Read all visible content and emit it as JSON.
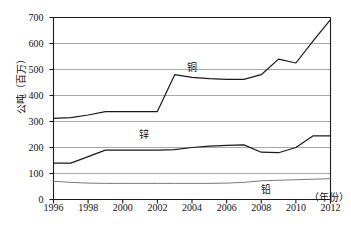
{
  "chart_data": {
    "type": "line",
    "title": "",
    "xlabel": "（年份）",
    "ylabel": "公吨（百万）",
    "xlim": [
      1996,
      2012
    ],
    "ylim": [
      0,
      700
    ],
    "xticks": [
      "1996",
      "1998",
      "2000",
      "2002",
      "2004",
      "2006",
      "2008",
      "2010",
      "2012"
    ],
    "yticks": [
      "0",
      "100",
      "200",
      "300",
      "400",
      "500",
      "600",
      "700"
    ],
    "grid": true,
    "legend_position": "inline-labels",
    "x": [
      1996,
      1997,
      1998,
      1999,
      2000,
      2001,
      2002,
      2003,
      2004,
      2005,
      2006,
      2007,
      2008,
      2009,
      2010,
      2011,
      2012
    ],
    "series": [
      {
        "name": "铜",
        "label": "铜",
        "color": "#1a1a1a",
        "values": [
          312,
          315,
          325,
          338,
          338,
          338,
          338,
          480,
          470,
          465,
          462,
          462,
          480,
          540,
          525,
          610,
          692
        ]
      },
      {
        "name": "锌",
        "label": "锌",
        "color": "#1a1a1a",
        "values": [
          140,
          140,
          165,
          190,
          190,
          190,
          190,
          192,
          200,
          205,
          208,
          210,
          182,
          180,
          200,
          245,
          245
        ]
      },
      {
        "name": "铅",
        "label": "铅",
        "color": "#6a6a6a",
        "values": [
          70,
          66,
          63,
          62,
          62,
          62,
          62,
          62,
          62,
          62,
          63,
          66,
          72,
          74,
          76,
          78,
          80
        ]
      }
    ],
    "annotations": [
      {
        "text": "铜",
        "x": 2004,
        "y": 505
      },
      {
        "text": "锌",
        "x": 2001.2,
        "y": 250
      },
      {
        "text": "铅",
        "x": 2008.3,
        "y": 35
      }
    ]
  }
}
